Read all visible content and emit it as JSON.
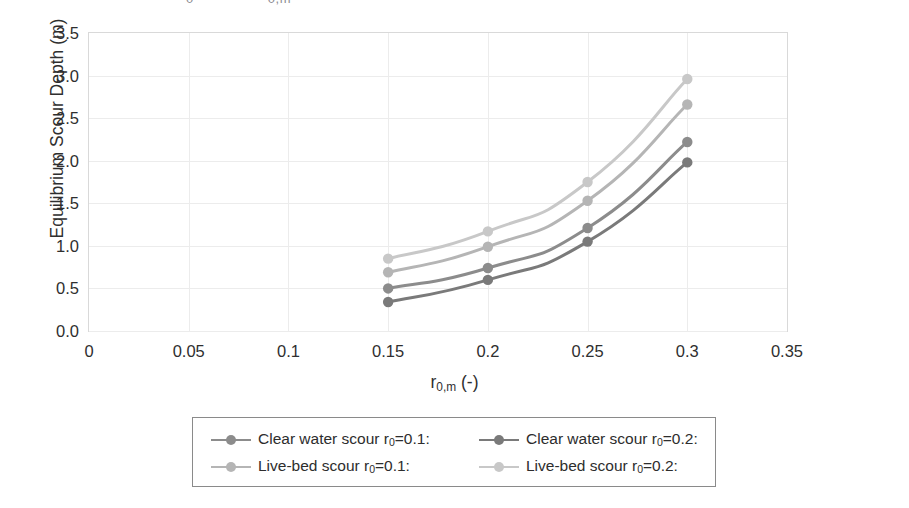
{
  "top_fragment": {
    "frag1": "0",
    "frag2": "0,m"
  },
  "axes": {
    "y_title": "Equilibrium Scour Depth (m)",
    "x_title_main": "r",
    "x_title_sub": "0,m",
    "x_title_unit": " (-)",
    "y_ticks": [
      "0.0",
      "0.5",
      "1.0",
      "1.5",
      "2.0",
      "2.5",
      "3.0",
      "3.5"
    ],
    "x_ticks": [
      "0",
      "0.05",
      "0.1",
      "0.15",
      "0.2",
      "0.25",
      "0.3",
      "0.35"
    ]
  },
  "legend": {
    "rows": [
      [
        {
          "label_pre": "Clear water scour r",
          "label_sub": "0",
          "label_post": "=0.1:",
          "color": "#8c8c8c"
        },
        {
          "label_pre": "Clear water scour r",
          "label_sub": "0",
          "label_post": "=0.2:",
          "color": "#7a7a7a"
        }
      ],
      [
        {
          "label_pre": "Live-bed scour r",
          "label_sub": "0",
          "label_post": "=0.1:",
          "color": "#b5b5b5"
        },
        {
          "label_pre": "Live-bed scour r",
          "label_sub": "0",
          "label_post": "=0.2:",
          "color": "#c8c8c8"
        }
      ]
    ]
  },
  "chart_data": {
    "type": "line",
    "title": "",
    "xlabel": "r0,m (-)",
    "ylabel": "Equilibrium Scour Depth (m)",
    "xlim": [
      0,
      0.35
    ],
    "ylim": [
      0,
      3.5
    ],
    "xticks": [
      0,
      0.05,
      0.1,
      0.15,
      0.2,
      0.25,
      0.3,
      0.35
    ],
    "yticks": [
      0.0,
      0.5,
      1.0,
      1.5,
      2.0,
      2.5,
      3.0,
      3.5
    ],
    "grid": true,
    "legend_position": "below",
    "x": [
      0.15,
      0.2,
      0.25,
      0.3
    ],
    "series": [
      {
        "name": "Clear water scour r0=0.2:",
        "color": "#7a7a7a",
        "values": [
          0.34,
          0.6,
          1.05,
          1.98
        ]
      },
      {
        "name": "Clear water scour r0=0.1:",
        "color": "#8c8c8c",
        "values": [
          0.5,
          0.74,
          1.21,
          2.22
        ]
      },
      {
        "name": "Live-bed scour r0=0.1:",
        "color": "#b5b5b5",
        "values": [
          0.69,
          0.99,
          1.53,
          2.66
        ]
      },
      {
        "name": "Live-bed scour r0=0.2:",
        "color": "#c8c8c8",
        "values": [
          0.85,
          1.17,
          1.75,
          2.96
        ]
      }
    ]
  }
}
